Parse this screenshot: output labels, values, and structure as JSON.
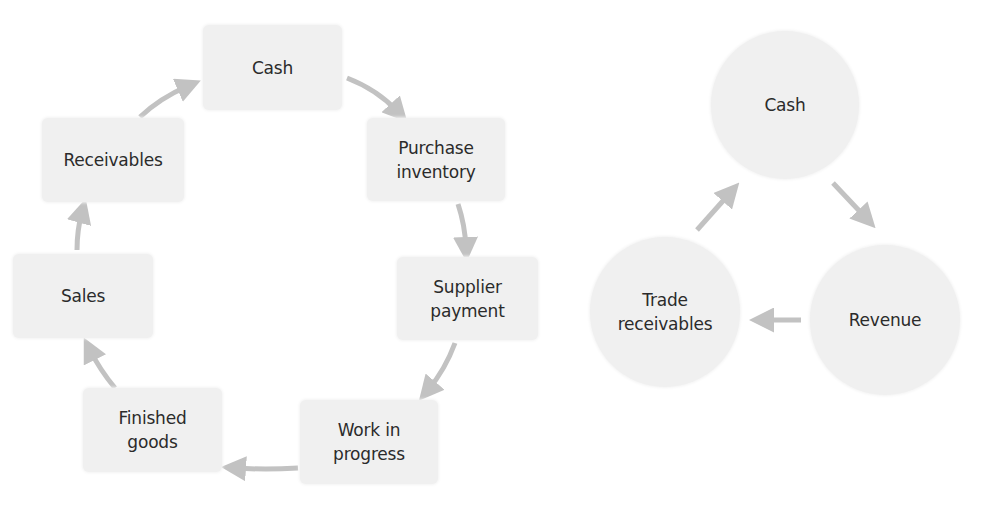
{
  "colors": {
    "node_fill": "#f0f0f0",
    "arrow": "#c2c2c2",
    "text": "#2b2b2b",
    "background": "#ffffff"
  },
  "working_capital_cycle": {
    "nodes": [
      {
        "id": "cash",
        "label": "Cash"
      },
      {
        "id": "purchase_inventory",
        "label": "Purchase\ninventory"
      },
      {
        "id": "supplier_payment",
        "label": "Supplier\npayment"
      },
      {
        "id": "work_in_progress",
        "label": "Work in\nprogress"
      },
      {
        "id": "finished_goods",
        "label": "Finished\ngoods"
      },
      {
        "id": "sales",
        "label": "Sales"
      },
      {
        "id": "receivables",
        "label": "Receivables"
      }
    ],
    "edges": [
      {
        "from": "cash",
        "to": "purchase_inventory"
      },
      {
        "from": "purchase_inventory",
        "to": "supplier_payment"
      },
      {
        "from": "supplier_payment",
        "to": "work_in_progress"
      },
      {
        "from": "work_in_progress",
        "to": "finished_goods"
      },
      {
        "from": "finished_goods",
        "to": "sales"
      },
      {
        "from": "sales",
        "to": "receivables"
      },
      {
        "from": "receivables",
        "to": "cash"
      }
    ]
  },
  "simple_cycle": {
    "nodes": [
      {
        "id": "cash",
        "label": "Cash"
      },
      {
        "id": "revenue",
        "label": "Revenue"
      },
      {
        "id": "trade_receivables",
        "label": "Trade\nreceivables"
      }
    ],
    "edges": [
      {
        "from": "cash",
        "to": "revenue"
      },
      {
        "from": "revenue",
        "to": "trade_receivables"
      },
      {
        "from": "trade_receivables",
        "to": "cash"
      }
    ]
  }
}
